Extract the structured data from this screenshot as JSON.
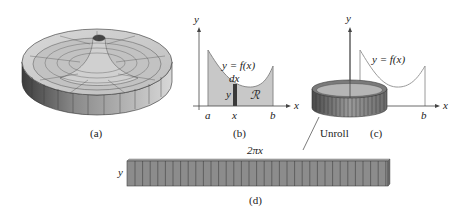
{
  "figure": {
    "panels": [
      {
        "id": "a",
        "caption": "(a)",
        "description": "solid of revolution with central spire"
      },
      {
        "id": "b",
        "caption": "(b)",
        "axis_x": "x",
        "axis_y": "y",
        "curve_label": "y = f(x)",
        "region_label": "ℛ",
        "strip_width_label": "dx",
        "strip_height_label": "y",
        "tick_a": "a",
        "tick_x": "x",
        "tick_b": "b"
      },
      {
        "id": "c",
        "caption": "(c)",
        "axis_x": "x",
        "axis_y": "y",
        "curve_label": "y = f(x)",
        "tick_b": "b",
        "annotation": "Unroll"
      },
      {
        "id": "d",
        "caption": "(d)",
        "length_label": "2πx",
        "height_label": "y"
      }
    ],
    "colors": {
      "fill_region": "#c8c8c8",
      "curve": "#9a9a9a",
      "strip": "#3a3a3a",
      "shell": "#8a8a8a",
      "axis": "#444444"
    }
  }
}
